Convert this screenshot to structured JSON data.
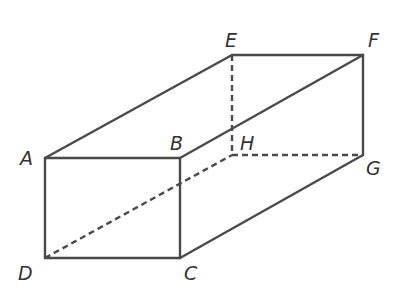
{
  "diagram": {
    "type": "rectangular-prism",
    "colors": {
      "line": "#4a4a4a",
      "label": "#333333",
      "background": "#ffffff"
    },
    "vertices": {
      "A": {
        "x": 45,
        "y": 158,
        "label": "A",
        "lx": 20,
        "ly": 165
      },
      "B": {
        "x": 180,
        "y": 158,
        "label": "B",
        "lx": 170,
        "ly": 150
      },
      "C": {
        "x": 180,
        "y": 258,
        "label": "C",
        "lx": 184,
        "ly": 280
      },
      "D": {
        "x": 45,
        "y": 258,
        "label": "D",
        "lx": 18,
        "ly": 280
      },
      "E": {
        "x": 232,
        "y": 55,
        "label": "E",
        "lx": 225,
        "ly": 47
      },
      "F": {
        "x": 363,
        "y": 55,
        "label": "F",
        "lx": 368,
        "ly": 47
      },
      "G": {
        "x": 363,
        "y": 155,
        "label": "G",
        "lx": 366,
        "ly": 175
      },
      "H": {
        "x": 232,
        "y": 155,
        "label": "H",
        "lx": 240,
        "ly": 150
      }
    },
    "solid_edges": [
      "AB",
      "BC",
      "CD",
      "DA",
      "AE",
      "EF",
      "BF",
      "FG",
      "CG"
    ],
    "hidden_edges": [
      "EH",
      "HG",
      "DH"
    ]
  }
}
